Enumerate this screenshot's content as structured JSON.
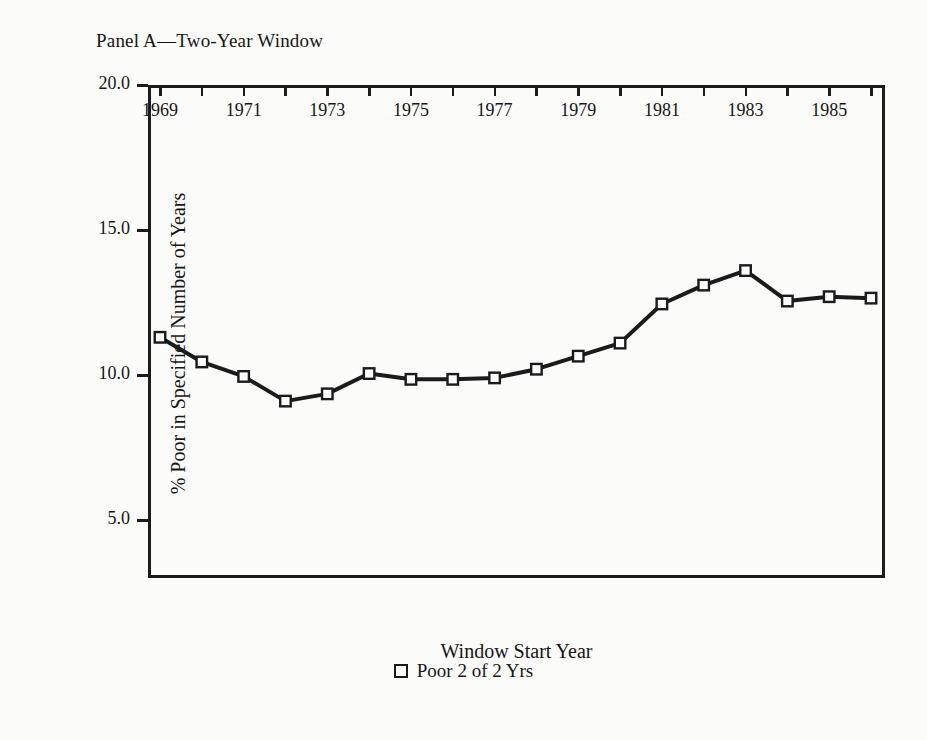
{
  "figure": {
    "panel_title": "Panel A—Two-Year Window",
    "background_color": "#fbfbfa",
    "ink_color": "#1b1b1b"
  },
  "chart_data": {
    "type": "line",
    "title": "Panel A—Two-Year Window",
    "xlabel": "Window Start Year",
    "ylabel": "% Poor in Specified Number of Years",
    "xlim": [
      1969,
      1986
    ],
    "ylim": [
      3.0,
      20.0
    ],
    "yticks": [
      "5.0",
      "10.0",
      "15.0",
      "20.0"
    ],
    "ytick_values": [
      5.0,
      10.0,
      15.0,
      20.0
    ],
    "xticks": [
      1969,
      1970,
      1971,
      1972,
      1973,
      1974,
      1975,
      1976,
      1977,
      1978,
      1979,
      1980,
      1981,
      1982,
      1983,
      1984,
      1985,
      1986
    ],
    "xtick_labels": [
      "1969",
      "",
      "1971",
      "",
      "1973",
      "",
      "1975",
      "",
      "1977",
      "",
      "1979",
      "",
      "1981",
      "",
      "1983",
      "",
      "1985",
      ""
    ],
    "grid": false,
    "legend_position": "below-axis-centered",
    "legend": [
      {
        "label": "Poor 2 of 2 Yrs",
        "marker": "open-square",
        "color": "#1b1b1b"
      }
    ],
    "series": [
      {
        "name": "Poor 2 of 2 Yrs",
        "marker": "open-square",
        "color": "#1b1b1b",
        "x": [
          1969,
          1970,
          1971,
          1972,
          1973,
          1974,
          1975,
          1976,
          1977,
          1978,
          1979,
          1980,
          1981,
          1982,
          1983,
          1984,
          1985,
          1986
        ],
        "values": [
          11.3,
          10.45,
          9.95,
          9.1,
          9.35,
          10.05,
          9.85,
          9.85,
          9.9,
          10.2,
          10.65,
          11.1,
          12.45,
          13.1,
          13.6,
          12.55,
          12.7,
          12.65
        ]
      }
    ]
  }
}
